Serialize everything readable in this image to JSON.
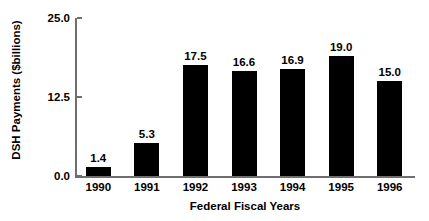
{
  "chart_data": {
    "type": "bar",
    "title": "",
    "xlabel": "Federal Fiscal Years",
    "ylabel": "DSH Payments ($billions)",
    "categories": [
      "1990",
      "1991",
      "1992",
      "1993",
      "1994",
      "1995",
      "1996"
    ],
    "values": [
      1.4,
      5.3,
      17.5,
      16.6,
      16.9,
      19.0,
      15.0
    ],
    "data_labels": [
      "1.4",
      "5.3",
      "17.5",
      "16.6",
      "16.9",
      "19.0",
      "15.0"
    ],
    "ylim": [
      0.0,
      25.0
    ],
    "yticks": [
      0.0,
      12.5,
      25.0
    ],
    "ytick_labels": [
      "0.0",
      "12.5",
      "25.0"
    ],
    "grid": false,
    "legend": null,
    "bar_color": "#000000",
    "background_color": "#ffffff",
    "axis_color": "#6f6f6f"
  }
}
